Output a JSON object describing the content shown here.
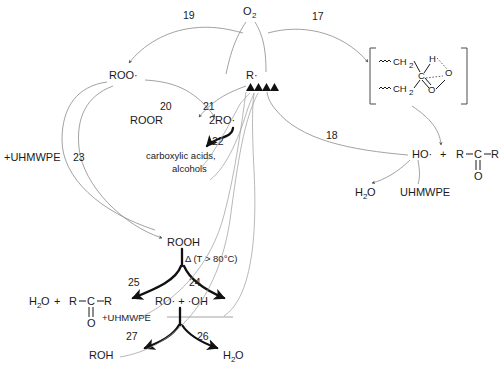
{
  "diagram": {
    "type": "reaction-scheme"
  },
  "species": {
    "oxygen": "O",
    "oxygen_sub": "2",
    "alkyl_radical": "R·",
    "peroxy_radical": "ROO·",
    "peroxide": "ROOR",
    "alkoxy_radicals": "2RO·",
    "carboxylic_products_line1": "carboxylic acids,",
    "carboxylic_products_line2": "alcohols",
    "hydroperoxide": "ROOH",
    "thermal_condition": "Δ (T > 80°C)",
    "water": "H",
    "water_sub": "2",
    "water_tail": "O",
    "hydroxyl_radical": "HO·",
    "alkoxy_hydroxyl": "RO· + ·OH",
    "alcohol": "ROH",
    "polymer_left": "+UHMWPE",
    "polymer_mid": "+UHMWPE",
    "polymer_right": "UHMWPE",
    "plus": "+",
    "ketone_R_left": "R",
    "ketone_C": "C",
    "ketone_R_right": "R",
    "ketone_O": "O"
  },
  "intermediate": {
    "squiggle": "∿∿",
    "ch2_upper": "CH",
    "ch2_upper_sub": "2",
    "ch2_lower": "CH",
    "ch2_lower_sub": "2",
    "carbon": "C",
    "hydrogen": "H",
    "oxygen_upper": "O",
    "oxygen_lower": "O"
  },
  "step_numbers": {
    "n17": "17",
    "n18": "18",
    "n19": "19",
    "n20": "20",
    "n21": "21",
    "n22": "22",
    "n23": "23",
    "n24": "24",
    "n25": "25",
    "n26": "26",
    "n27": "27"
  },
  "colors": {
    "background": "#ffffff",
    "text": "#1a1a1a",
    "thin_arrow": "#8a8a8a",
    "bold_arrow": "#111111"
  }
}
